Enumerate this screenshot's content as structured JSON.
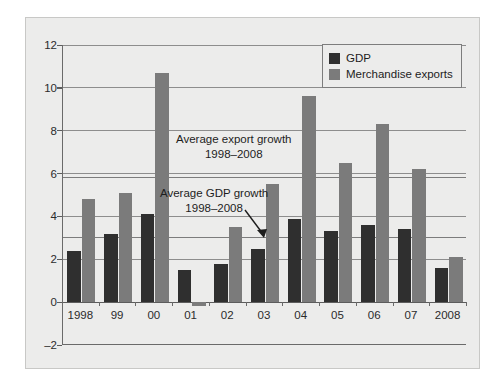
{
  "chart_data": {
    "type": "bar",
    "title": "",
    "subtitle": "",
    "xlabel": "",
    "ylabel": "",
    "categories": [
      "1998",
      "99",
      "00",
      "01",
      "02",
      "03",
      "04",
      "05",
      "06",
      "07",
      "2008"
    ],
    "series": [
      {
        "name": "GDP",
        "color": "#2f2f2f",
        "values": [
          2.4,
          3.2,
          4.1,
          1.5,
          1.8,
          2.5,
          3.9,
          3.3,
          3.6,
          3.4,
          1.6
        ]
      },
      {
        "name": "Merchandise exports",
        "color": "#7b7b7b",
        "values": [
          4.8,
          5.1,
          10.7,
          -0.2,
          3.5,
          5.5,
          9.6,
          6.5,
          8.3,
          6.2,
          2.1
        ]
      }
    ],
    "ylim": [
      -2,
      12
    ],
    "yticks": [
      -2,
      0,
      2,
      4,
      6,
      8,
      10,
      12
    ],
    "ytick_labels": [
      "–2",
      "0",
      "2",
      "4",
      "6",
      "8",
      "10",
      "12"
    ],
    "grid": true,
    "legend_position": "top-right",
    "reference_lines": [
      {
        "name": "Average export growth 1998–2008",
        "value": 5.8
      },
      {
        "name": "Average GDP growth 1998–2008",
        "value": 3.0
      }
    ],
    "annotations": [
      {
        "name": "average-export-growth",
        "line1": "Average export growth",
        "line2": "1998–2008"
      },
      {
        "name": "average-gdp-growth",
        "line1": "Average GDP growth",
        "line2": "1998–2008"
      }
    ]
  },
  "legend": {
    "items": [
      {
        "label": "GDP",
        "color": "#2f2f2f"
      },
      {
        "label": "Merchandise exports",
        "color": "#7b7b7b"
      }
    ]
  }
}
